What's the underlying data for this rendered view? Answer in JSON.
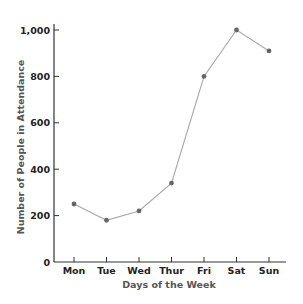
{
  "chart_data": {
    "type": "line",
    "title": "",
    "xlabel": "Days of the Week",
    "ylabel": "Number of People in Attendance",
    "categories": [
      "Mon",
      "Tue",
      "Wed",
      "Thur",
      "Fri",
      "Sat",
      "Sun"
    ],
    "series": [
      {
        "name": "Attendance",
        "values": [
          250,
          180,
          220,
          340,
          800,
          1000,
          910
        ]
      }
    ],
    "yticks": [
      0,
      200,
      400,
      600,
      800,
      1000
    ],
    "ytick_labels": [
      "0",
      "200",
      "400",
      "600",
      "800",
      "1,000"
    ],
    "ylim": [
      0,
      1000
    ],
    "grid": false,
    "legend": null,
    "colors": {
      "line": "#aaaaaa",
      "marker": "#666666",
      "axis": "#333333"
    }
  }
}
